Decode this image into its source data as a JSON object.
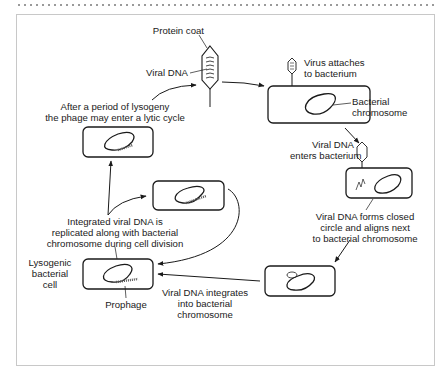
{
  "diagram": {
    "type": "lysogenic-cycle",
    "labels": {
      "protein_coat": "Protein coat",
      "viral_dna": "Viral DNA",
      "virus_attaches_1": "Virus attaches",
      "virus_attaches_2": "to bacterium",
      "bacterial_chromosome_1": "Bacterial",
      "bacterial_chromosome_2": "chromosome",
      "viral_dna_enters_1": "Viral DNA",
      "viral_dna_enters_2": "enters bacterium",
      "forms_circle_1": "Viral DNA forms closed",
      "forms_circle_2": "circle and aligns next",
      "forms_circle_3": "to bacterial chromosome",
      "integrates_1": "Viral DNA integrates",
      "integrates_2": "into bacterial",
      "integrates_3": "chromosome",
      "lysogenic_1": "Lysogenic",
      "lysogenic_2": "bacterial",
      "lysogenic_3": "cell",
      "prophage": "Prophage",
      "replicated_1": "Integrated viral DNA is",
      "replicated_2": "replicated along with bacterial",
      "replicated_3": "chromosome during cell division",
      "lytic_1": "After a period of lysogeny",
      "lytic_2": "the phage may enter a lytic cycle"
    },
    "colors": {
      "stroke": "#1a1a1a",
      "frame_border": "#c8c8c8",
      "background": "#ffffff"
    }
  }
}
